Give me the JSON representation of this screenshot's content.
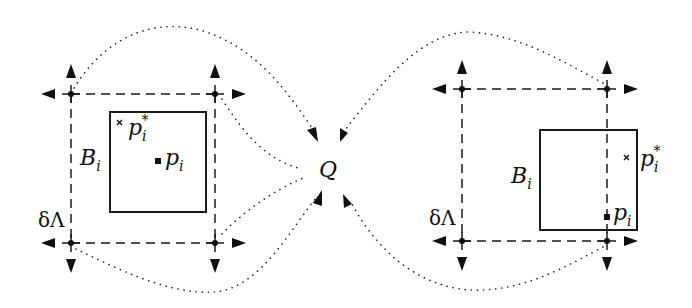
{
  "diagram": {
    "center_label": "Q",
    "groups": [
      {
        "id": "left",
        "box_label": "B",
        "box_label_sub": "i",
        "boundary_label": "δΛ",
        "point_label": "p",
        "point_label_sub": "i",
        "star_point_label": "p",
        "star_point_sub": "i",
        "star_point_sup": "*"
      },
      {
        "id": "right",
        "box_label": "B",
        "box_label_sub": "i",
        "boundary_label": "δΛ",
        "point_label": "p",
        "point_label_sub": "i",
        "star_point_label": "p",
        "star_point_sub": "i",
        "star_point_sup": "*"
      }
    ],
    "colors": {
      "stroke": "#1a1a1a",
      "background": "#ffffff"
    }
  }
}
